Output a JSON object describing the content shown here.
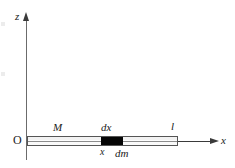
{
  "figure": {
    "kind": "physics-diagram",
    "background_color": "#ffffff",
    "ink_color": "#1a1a1a"
  },
  "axes": {
    "vertical": {
      "label": "z",
      "arrow_direction": "up",
      "color": "#6b6b6b"
    },
    "horizontal": {
      "label": "x",
      "arrow_direction": "right",
      "color": "#3a3a3a"
    },
    "origin": {
      "label": "O"
    }
  },
  "rod": {
    "mass_label": "M",
    "length_label": "l",
    "fill_color": "#fdfdfd",
    "outline_color": "#555555"
  },
  "mass_element": {
    "width_label": "dx",
    "mass_label": "dm",
    "position_label": "x",
    "fill_color": "#060606"
  }
}
